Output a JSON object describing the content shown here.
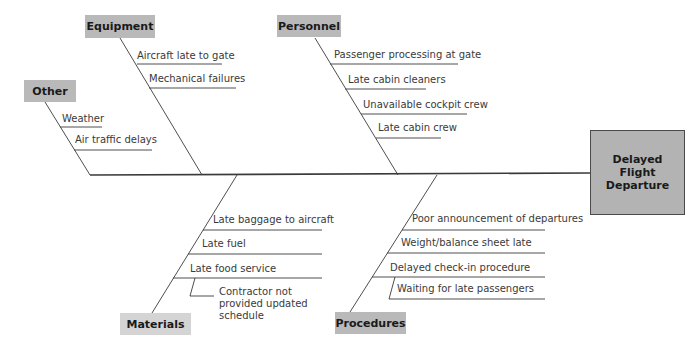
{
  "diagram": {
    "type": "fishbone",
    "effect": "Delayed Flight Departure",
    "colors": {
      "line": "#3a3a3a",
      "category_box": "#b9b9b9",
      "category_box_light": "#d4d4d4",
      "effect_box": "#b3b3b3",
      "text": "#3a3a3a"
    },
    "categories": {
      "equipment": {
        "label": "Equipment",
        "causes": [
          "Aircraft late to gate",
          "Mechanical failures"
        ]
      },
      "personnel": {
        "label": "Personnel",
        "causes": [
          "Passenger processing at gate",
          "Late cabin cleaners",
          "Unavailable cockpit crew",
          "Late cabin crew"
        ]
      },
      "other": {
        "label": "Other",
        "causes": [
          "Weather",
          "Air traffic delays"
        ]
      },
      "materials": {
        "label": "Materials",
        "causes": [
          "Late baggage to aircraft",
          "Late fuel",
          "Late food service"
        ],
        "sub_causes": [
          "Contractor not provided updated schedule"
        ]
      },
      "procedures": {
        "label": "Procedures",
        "causes": [
          "Poor announcement of departures",
          "Weight/balance sheet late",
          "Delayed check-in procedure"
        ],
        "sub_causes": [
          "Waiting for late passengers"
        ]
      }
    }
  }
}
